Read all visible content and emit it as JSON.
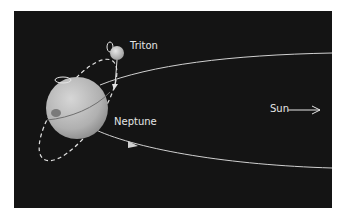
{
  "diagram": {
    "labels": {
      "triton": "Triton",
      "neptune": "Neptune",
      "sun": "Sun"
    },
    "colors": {
      "background": "#141414",
      "planet": "#b8b8b8",
      "orbit": "#d8d8d8",
      "text": "#e6e6e6"
    }
  }
}
